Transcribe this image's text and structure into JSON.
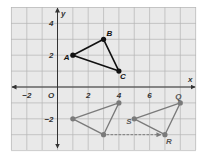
{
  "figure": {
    "x_axis_label": "x",
    "y_axis_label": "y",
    "origin_label": "O",
    "x_tick_labels": [
      {
        "value": -2,
        "label": "−2"
      },
      {
        "value": 2,
        "label": "2"
      },
      {
        "value": 4,
        "label": "4"
      },
      {
        "value": 6,
        "label": "6"
      }
    ],
    "y_tick_labels": [
      {
        "value": 4,
        "label": "4"
      },
      {
        "value": 2,
        "label": "2"
      },
      {
        "value": -2,
        "label": "−2"
      }
    ],
    "xlim": [
      -3,
      9
    ],
    "ylim": [
      -4,
      5
    ],
    "colors": {
      "background": "#e9e9e9",
      "grid": "#b5b5b5",
      "axis": "#333333",
      "triangle_abc": "#111111",
      "triangle_gray": "#7a7a7a"
    }
  },
  "chart_data": {
    "type": "scatter",
    "title": "",
    "xlabel": "x",
    "ylabel": "y",
    "xlim": [
      -3,
      9
    ],
    "ylim": [
      -4,
      5
    ],
    "grid": true,
    "series": [
      {
        "name": "Triangle ABC",
        "color": "#111111",
        "points": [
          {
            "label": "A",
            "x": 1,
            "y": 2
          },
          {
            "label": "B",
            "x": 3,
            "y": 3
          },
          {
            "label": "C",
            "x": 4,
            "y": 1
          }
        ]
      },
      {
        "name": "Intermediate triangle",
        "color": "#7a7a7a",
        "points": [
          {
            "label": "",
            "x": 1,
            "y": -2
          },
          {
            "label": "",
            "x": 4,
            "y": -1
          },
          {
            "label": "",
            "x": 3,
            "y": -3
          }
        ]
      },
      {
        "name": "Triangle QRS",
        "color": "#7a7a7a",
        "points": [
          {
            "label": "Q",
            "x": 8,
            "y": -1
          },
          {
            "label": "R",
            "x": 7,
            "y": -3
          },
          {
            "label": "S",
            "x": 5,
            "y": -2
          }
        ]
      }
    ],
    "annotations": [
      {
        "type": "dashed-arrow",
        "from": [
          3,
          -3
        ],
        "to": [
          7,
          -3
        ]
      }
    ]
  }
}
